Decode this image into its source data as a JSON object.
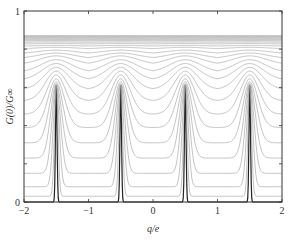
{
  "chart_data": {
    "type": "line",
    "title": "",
    "xlabel": "q/e",
    "ylabel": "G(0)/G∞",
    "xlim": [
      -2,
      2
    ],
    "ylim": [
      0,
      1
    ],
    "x_ticks": [
      -2,
      -1,
      0,
      1,
      2
    ],
    "x_tick_labels": [
      "−2",
      "−1",
      "0",
      "1",
      "2"
    ],
    "y_ticks": [
      0,
      0.2,
      0.4,
      0.6,
      0.8,
      1
    ],
    "y_tick_labels": [
      "0",
      "",
      "",
      "",
      "",
      "1"
    ],
    "grid": false,
    "legend": null,
    "peak_positions": [
      -1.5,
      -0.5,
      0.5,
      1.5
    ],
    "series_params": {
      "sharp_curve": {
        "peak": 0.61,
        "min": 0.0,
        "color": "#222222"
      },
      "family": [
        {
          "peak": 0.61,
          "min": 0.0
        },
        {
          "peak": 0.61,
          "min": 0.03
        },
        {
          "peak": 0.61,
          "min": 0.08
        },
        {
          "peak": 0.615,
          "min": 0.15
        },
        {
          "peak": 0.62,
          "min": 0.23
        },
        {
          "peak": 0.63,
          "min": 0.31
        },
        {
          "peak": 0.645,
          "min": 0.39
        },
        {
          "peak": 0.665,
          "min": 0.46
        },
        {
          "peak": 0.685,
          "min": 0.53
        },
        {
          "peak": 0.705,
          "min": 0.59
        },
        {
          "peak": 0.725,
          "min": 0.64
        },
        {
          "peak": 0.745,
          "min": 0.68
        },
        {
          "peak": 0.765,
          "min": 0.72
        },
        {
          "peak": 0.78,
          "min": 0.75
        },
        {
          "peak": 0.795,
          "min": 0.775
        },
        {
          "peak": 0.81,
          "min": 0.8
        },
        {
          "peak": 0.82,
          "min": 0.815
        },
        {
          "peak": 0.83,
          "min": 0.826
        },
        {
          "peak": 0.838,
          "min": 0.835
        },
        {
          "peak": 0.845,
          "min": 0.843
        },
        {
          "peak": 0.85,
          "min": 0.849
        },
        {
          "peak": 0.855,
          "min": 0.854
        },
        {
          "peak": 0.86,
          "min": 0.859
        },
        {
          "peak": 0.864,
          "min": 0.863
        },
        {
          "peak": 0.868,
          "min": 0.867
        },
        {
          "peak": 0.871,
          "min": 0.871
        }
      ],
      "family_color": "#9a9a9a"
    }
  }
}
